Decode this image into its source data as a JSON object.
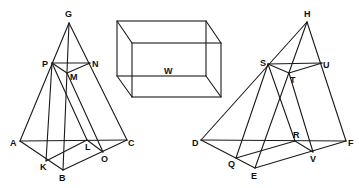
{
  "figure": {
    "box_label": "W",
    "left_pyramid": {
      "labels": {
        "G": "G",
        "P": "P",
        "N": "N",
        "M": "M",
        "A": "A",
        "C": "C",
        "L": "L",
        "O": "O",
        "K": "K",
        "B": "B"
      }
    },
    "right_pyramid": {
      "labels": {
        "H": "H",
        "S": "S",
        "U": "U",
        "T": "T",
        "D": "D",
        "F": "F",
        "R": "R",
        "V": "V",
        "Q": "Q",
        "E": "E"
      }
    }
  }
}
